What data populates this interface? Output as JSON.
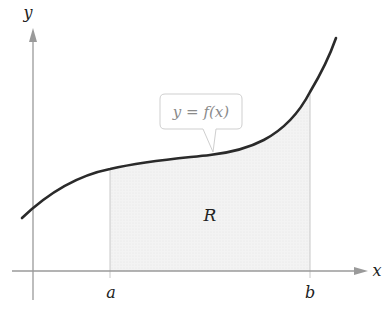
{
  "diagram": {
    "axes": {
      "x_label": "x",
      "y_label": "y",
      "axis_color": "#9a9a9a"
    },
    "curve": {
      "label": "y = f(x)",
      "color": "#2a2a2a"
    },
    "region": {
      "label": "R",
      "fill_color": "#f0f0f0",
      "left_bound_label": "a",
      "right_bound_label": "b"
    }
  }
}
